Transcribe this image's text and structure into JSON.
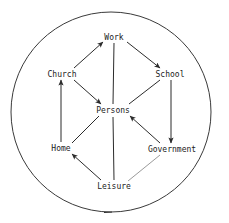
{
  "diagram": {
    "type": "node-link-diagram",
    "enclosure": {
      "shape": "circle",
      "name": "society-boundary-circle",
      "center_x": 111,
      "center_y": 112,
      "radius": 100,
      "stroke_color": "#3a3a3a",
      "stroke_width": 1
    },
    "style": {
      "line_color": "#2b2b2b",
      "line_width": 1,
      "text_color": "#1a1a1a",
      "background_color": "#ffffff",
      "faint_line_color": "#9a9a9a"
    },
    "nodes": [
      {
        "id": "work",
        "label": "Work",
        "x": 114,
        "y": 37
      },
      {
        "id": "church",
        "label": "Church",
        "x": 62,
        "y": 74
      },
      {
        "id": "school",
        "label": "School",
        "x": 170,
        "y": 74
      },
      {
        "id": "persons",
        "label": "Persons",
        "x": 113,
        "y": 110
      },
      {
        "id": "home",
        "label": "Home",
        "x": 61,
        "y": 148
      },
      {
        "id": "government",
        "label": "Government",
        "x": 172,
        "y": 149
      },
      {
        "id": "leisure",
        "label": "Leisure",
        "x": 114,
        "y": 186
      }
    ],
    "edges": [
      {
        "id": "church-work",
        "from": "church",
        "to": "work",
        "arrow": "to-target"
      },
      {
        "id": "work-school",
        "from": "work",
        "to": "school",
        "arrow": "to-target"
      },
      {
        "id": "work-persons",
        "from": "work",
        "to": "persons",
        "arrow": "none"
      },
      {
        "id": "church-persons",
        "from": "church",
        "to": "persons",
        "arrow": "to-target"
      },
      {
        "id": "persons-school",
        "from": "persons",
        "to": "school",
        "arrow": "none"
      },
      {
        "id": "home-church",
        "from": "home",
        "to": "church",
        "arrow": "to-target"
      },
      {
        "id": "school-government",
        "from": "school",
        "to": "government",
        "arrow": "to-target"
      },
      {
        "id": "home-persons",
        "from": "home",
        "to": "persons",
        "arrow": "none"
      },
      {
        "id": "government-persons",
        "from": "government",
        "to": "persons",
        "arrow": "to-target"
      },
      {
        "id": "persons-leisure",
        "from": "persons",
        "to": "leisure",
        "arrow": "none"
      },
      {
        "id": "leisure-home",
        "from": "leisure",
        "to": "home",
        "arrow": "to-target"
      },
      {
        "id": "government-leisure",
        "from": "government",
        "to": "leisure",
        "arrow": "none",
        "faint": true
      }
    ]
  }
}
